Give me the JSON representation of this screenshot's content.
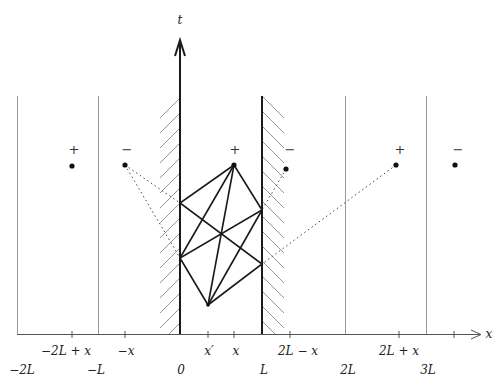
{
  "diagram": {
    "type": "method-of-images spacetime diagram",
    "axes": {
      "t_label": "t",
      "x_label": "x"
    },
    "walls": {
      "left": {
        "position": "0"
      },
      "right": {
        "position": "L"
      }
    },
    "tick_labels_upper": [
      "-2L + x",
      "-x",
      "x'",
      "x",
      "2L - x",
      "2L + x"
    ],
    "tick_labels_lower": [
      "-2L",
      "-L",
      "0",
      "L",
      "2L",
      "3L"
    ],
    "image_charges": [
      {
        "sign": "+",
        "region": "-2L + x"
      },
      {
        "sign": "−",
        "region": "-x"
      },
      {
        "sign": "+",
        "region": "x (source)"
      },
      {
        "sign": "−",
        "region": "2L - x"
      },
      {
        "sign": "+",
        "region": "2L + x"
      },
      {
        "sign": "−",
        "region": "beyond 3L"
      }
    ],
    "colors": {
      "line": "#1a1a1a",
      "thin_line": "#9a9a9a",
      "hatch": "#8a8a8a"
    }
  },
  "labels": {
    "t": "t",
    "x": "x",
    "upper": {
      "m2Lpx": "−2L + x",
      "mx": "−x",
      "xp": "x′",
      "x": "x",
      "2Lmx": "2L − x",
      "2Lpx": "2L + x"
    },
    "lower": {
      "m2L": "−2L",
      "mL": "−L",
      "zero": "0",
      "L": "L",
      "2L": "2L",
      "3L": "3L"
    },
    "signs": {
      "s1": "+",
      "s2": "−",
      "s3": "+",
      "s4": "−",
      "s5": "+",
      "s6": "−"
    }
  }
}
